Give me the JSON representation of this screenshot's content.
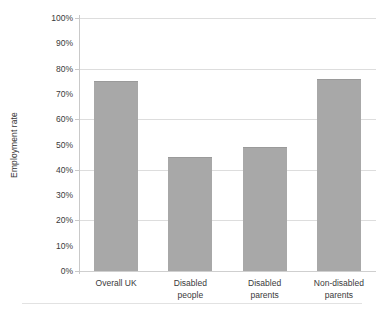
{
  "chart_data": {
    "type": "bar",
    "title": "",
    "xlabel": "",
    "ylabel": "Employment rate",
    "categories": [
      "Overall UK",
      "Disabled people",
      "Disabled parents",
      "Non-disabled parents"
    ],
    "values": [
      75,
      45,
      49,
      76
    ],
    "ylim": [
      0,
      100
    ],
    "y_tick_labels": [
      "0%",
      "10%",
      "20%",
      "30%",
      "40%",
      "50%",
      "60%",
      "70%",
      "80%",
      "90%",
      "100%"
    ],
    "y_tick_values": [
      0,
      10,
      20,
      30,
      40,
      50,
      60,
      70,
      80,
      90,
      100
    ],
    "gridline_values": [
      0,
      20,
      40,
      60,
      80,
      100
    ],
    "grid": true,
    "legend": "none",
    "bar_color": "#a8a8a8",
    "gridline_color": "#dddddd",
    "axis_color": "#c9c9c9",
    "background_color": "#ffffff",
    "series": [
      {
        "name": "Employment rate",
        "values": [
          75,
          45,
          49,
          76
        ]
      }
    ],
    "points": [
      {
        "category": "Overall UK",
        "label_line1": "Overall UK",
        "label_line2": "",
        "value": 75
      },
      {
        "category": "Disabled people",
        "label_line1": "Disabled",
        "label_line2": "people",
        "value": 45
      },
      {
        "category": "Disabled parents",
        "label_line1": "Disabled",
        "label_line2": "parents",
        "value": 49
      },
      {
        "category": "Non-disabled parents",
        "label_line1": "Non-disabled",
        "label_line2": "parents",
        "value": 76
      }
    ]
  }
}
